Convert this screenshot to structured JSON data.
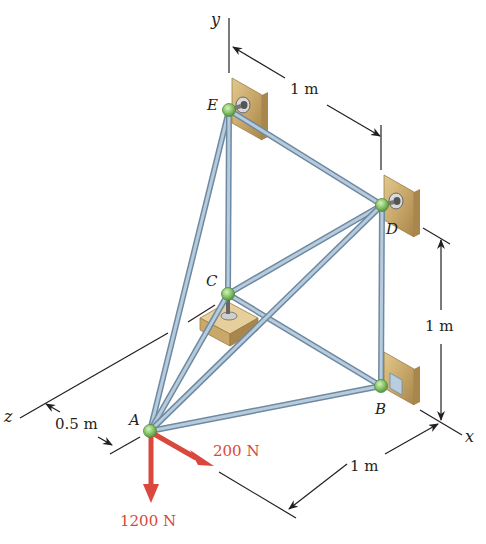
{
  "figure": {
    "type": "space-truss"
  },
  "axes": {
    "x": "x",
    "y": "y",
    "z": "z"
  },
  "nodes": [
    {
      "id": "A",
      "label": "A",
      "x": 150,
      "y": 431
    },
    {
      "id": "B",
      "label": "B",
      "x": 381,
      "y": 386
    },
    {
      "id": "C",
      "label": "C",
      "x": 228,
      "y": 294
    },
    {
      "id": "D",
      "label": "D",
      "x": 382,
      "y": 205
    },
    {
      "id": "E",
      "label": "E",
      "x": 229,
      "y": 110
    }
  ],
  "members": [
    [
      "A",
      "E"
    ],
    [
      "A",
      "C"
    ],
    [
      "A",
      "D"
    ],
    [
      "A",
      "B"
    ],
    [
      "E",
      "C"
    ],
    [
      "E",
      "D"
    ],
    [
      "C",
      "D"
    ],
    [
      "C",
      "B"
    ],
    [
      "D",
      "B"
    ]
  ],
  "dimensions": {
    "top": "1 m",
    "right": "1 m",
    "bottom": "1 m",
    "left": "0.5 m"
  },
  "loads": {
    "vertical": "1200 N",
    "horizontal": "200 N"
  },
  "colors": {
    "member": "#9db4c8",
    "member_edge": "#6e8aa3",
    "joint": "#8bc76a",
    "support": "#c9a86a",
    "force": "#d9473d",
    "ink": "#231f20"
  }
}
